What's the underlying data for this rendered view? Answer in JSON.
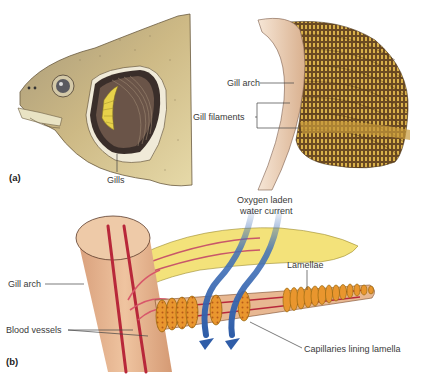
{
  "figure": {
    "panel_a": {
      "tag": "(a)",
      "labels": {
        "gills": "Gills",
        "gill_arch": "Gill arch",
        "gill_filaments": "Gill filaments"
      }
    },
    "panel_b": {
      "tag": "(b)",
      "labels": {
        "water_current_line1": "Oxygen laden",
        "water_current_line2": "water current",
        "gill_arch": "Gill arch",
        "lamellae": "Lamellae",
        "blood_vessels": "Blood vessels",
        "capillaries": "Capillaries lining lamella"
      }
    },
    "colors": {
      "fish_skin": "#c9b27a",
      "gill_cover_dark": "#3a2e2a",
      "gill_yellow": "#e8d24a",
      "arch_flesh": "#e8b892",
      "vessel_red": "#b8283a",
      "lamella_orange": "#d98a2a",
      "filament_yellow": "#f3e27a",
      "water_blue": "#3f6fb8",
      "filament_brown": "#6b4a22"
    }
  }
}
